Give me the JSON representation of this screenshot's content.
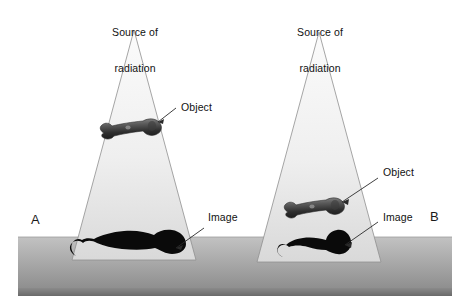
{
  "figure": {
    "background_color": "#ffffff",
    "width": 468,
    "height": 307
  },
  "colors": {
    "beam_fill_top": "#f2f2f2",
    "beam_fill_bottom": "#d8d8d8",
    "beam_outline": "#8c8c8c",
    "ground_top": "#b5b5b5",
    "ground_bottom": "#7d7d7d",
    "ground_front": "#6f6f6f",
    "shadow_fill": "#0b0b0b",
    "object_dark": "#3a3a3a",
    "object_light": "#c9c9c9",
    "leader_line": "#2a2a2a",
    "text": "#111111"
  },
  "panels": [
    {
      "id": "A",
      "letter": "A",
      "source_label_line1": "Source of",
      "source_label_line2": "radiation",
      "object_label": "Object",
      "image_label": "Image",
      "description": "Object positioned far from the film, producing a large magnified image"
    },
    {
      "id": "B",
      "letter": "B",
      "source_label_line1": "Source of",
      "source_label_line2": "radiation",
      "object_label": "Object",
      "image_label": "Image",
      "description": "Object positioned close to the film, producing a smaller image"
    }
  ],
  "annotations": {
    "panel_a": {
      "source_text": "Source of\nradiation",
      "object_text": "Object",
      "image_text": "Image",
      "letter_text": "A"
    },
    "panel_b": {
      "source_text": "Source of\nradiation",
      "object_text": "Object",
      "image_text": "Image",
      "letter_text": "B"
    }
  }
}
